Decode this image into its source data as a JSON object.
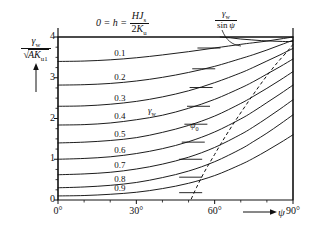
{
  "figure": {
    "title_formula": {
      "prefix": "0 = h =",
      "numerator": "HJs",
      "denominator": "2Ku"
    },
    "ylabel": {
      "numerator": "γw",
      "denominator": "√(AKu1)"
    },
    "xlabel": "ψ",
    "annotations": {
      "gamma_over_sin": {
        "numerator": "γw",
        "denominator": "sin ψ"
      },
      "gamma_w": "γw",
      "psi_zero": "ψ0"
    }
  },
  "chart_data": {
    "type": "line",
    "xlabel": "ψ",
    "ylabel": "γw / √(AKu1)",
    "xlim": [
      0,
      90
    ],
    "ylim": [
      0,
      4.2
    ],
    "xtick_labels": [
      "0°",
      "30°",
      "60°",
      "90°"
    ],
    "xticks": [
      0,
      30,
      60,
      90
    ],
    "xticks_minor": [
      10,
      20,
      40,
      50,
      70,
      80
    ],
    "ytick_labels": [
      "0",
      "1",
      "2",
      "3",
      "4"
    ],
    "yticks": [
      0,
      1,
      2,
      3,
      4
    ],
    "yticks_minor": [
      0.25,
      0.5,
      0.75,
      1.25,
      1.5,
      1.75,
      2.25,
      2.5,
      2.75,
      3.25,
      3.5,
      3.75
    ],
    "grid": false,
    "legend_position": "inline-curve-labels",
    "x": [
      0,
      10,
      20,
      30,
      40,
      50,
      60,
      70,
      75,
      80,
      85,
      90
    ],
    "series": [
      {
        "name": "0",
        "label": "0 = h",
        "label_x": 0,
        "label_y": 0,
        "values": [
          4.0,
          4.0,
          4.0,
          4.0,
          4.0,
          4.0,
          4.0,
          4.0,
          4.0,
          4.0,
          4.0,
          4.0
        ]
      },
      {
        "name": "0.1",
        "label": "0.1",
        "label_x": 20,
        "label_y": 3.58,
        "values": [
          3.4,
          3.41,
          3.44,
          3.49,
          3.56,
          3.64,
          3.73,
          3.82,
          3.86,
          3.9,
          3.95,
          4.0
        ]
      },
      {
        "name": "0.2",
        "label": "0.2",
        "label_x": 20,
        "label_y": 2.99,
        "values": [
          2.82,
          2.83,
          2.86,
          2.92,
          3.01,
          3.13,
          3.28,
          3.47,
          3.57,
          3.68,
          3.8,
          3.92
        ]
      },
      {
        "name": "0.3",
        "label": "0.3",
        "label_x": 20,
        "label_y": 2.49,
        "values": [
          2.3,
          2.31,
          2.35,
          2.42,
          2.53,
          2.68,
          2.88,
          3.12,
          3.26,
          3.41,
          3.56,
          3.72
        ]
      },
      {
        "name": "0.4",
        "label": "0.4",
        "label_x": 20,
        "label_y": 2.03,
        "values": [
          1.84,
          1.85,
          1.89,
          1.97,
          2.08,
          2.25,
          2.47,
          2.75,
          2.91,
          3.09,
          3.27,
          3.46
        ]
      },
      {
        "name": "0.5",
        "label": "0.5",
        "label_x": 20,
        "label_y": 1.6,
        "values": [
          1.4,
          1.42,
          1.46,
          1.53,
          1.66,
          1.83,
          2.06,
          2.37,
          2.55,
          2.74,
          2.94,
          3.15
        ]
      },
      {
        "name": "0.6",
        "label": "0.6",
        "label_x": 20,
        "label_y": 1.2,
        "values": [
          1.0,
          1.02,
          1.06,
          1.14,
          1.26,
          1.43,
          1.67,
          1.99,
          2.18,
          2.39,
          2.6,
          2.82
        ]
      },
      {
        "name": "0.7",
        "label": "0.7",
        "label_x": 20,
        "label_y": 0.83,
        "values": [
          0.62,
          0.64,
          0.68,
          0.76,
          0.88,
          1.05,
          1.29,
          1.61,
          1.8,
          2.01,
          2.23,
          2.46
        ]
      },
      {
        "name": "0.8",
        "label": "0.8",
        "label_x": 20,
        "label_y": 0.5,
        "values": [
          0.3,
          0.32,
          0.36,
          0.43,
          0.55,
          0.71,
          0.94,
          1.25,
          1.44,
          1.64,
          1.86,
          2.09
        ]
      },
      {
        "name": "0.9",
        "label": "0.9",
        "label_x": 20,
        "label_y": 0.26,
        "values": [
          0.1,
          0.11,
          0.14,
          0.19,
          0.28,
          0.41,
          0.6,
          0.87,
          1.03,
          1.21,
          1.4,
          1.6
        ]
      }
    ],
    "dashed_curve": {
      "name": "ψ0",
      "style": "dashed",
      "x": [
        51,
        53,
        56,
        60,
        64,
        68,
        72,
        76,
        80,
        84,
        88,
        90
      ],
      "y": [
        0.02,
        0.3,
        0.68,
        1.12,
        1.55,
        1.95,
        2.33,
        2.7,
        3.05,
        3.37,
        3.66,
        3.82
      ]
    },
    "envelope_curve": {
      "name": "γw / sin ψ",
      "style": "solid",
      "x": [
        62,
        66,
        70,
        74,
        78,
        82,
        86,
        90
      ],
      "y": [
        4.0,
        3.98,
        3.95,
        3.93,
        3.91,
        3.9,
        3.89,
        3.89
      ]
    },
    "intersection_marks": [
      {
        "x": 58,
        "y": 3.73
      },
      {
        "x": 56,
        "y": 3.22
      },
      {
        "x": 55,
        "y": 2.76
      },
      {
        "x": 54,
        "y": 2.3
      },
      {
        "x": 53,
        "y": 1.86
      },
      {
        "x": 52,
        "y": 1.42
      },
      {
        "x": 51,
        "y": 1.0
      },
      {
        "x": 51,
        "y": 0.56
      },
      {
        "x": 51,
        "y": 0.18
      }
    ]
  }
}
